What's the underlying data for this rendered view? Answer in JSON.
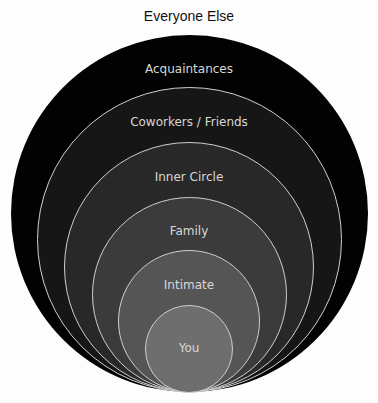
{
  "title": "Everyone Else",
  "rings": [
    {
      "label": "Acquaintances",
      "color": "#020202"
    },
    {
      "label": "Coworkers / Friends",
      "color": "#161616"
    },
    {
      "label": "Inner Circle",
      "color": "#282828"
    },
    {
      "label": "Family",
      "color": "#3b3b3b"
    },
    {
      "label": "Intimate",
      "color": "#555555"
    },
    {
      "label": "You",
      "color": "#6e6e6e"
    }
  ]
}
